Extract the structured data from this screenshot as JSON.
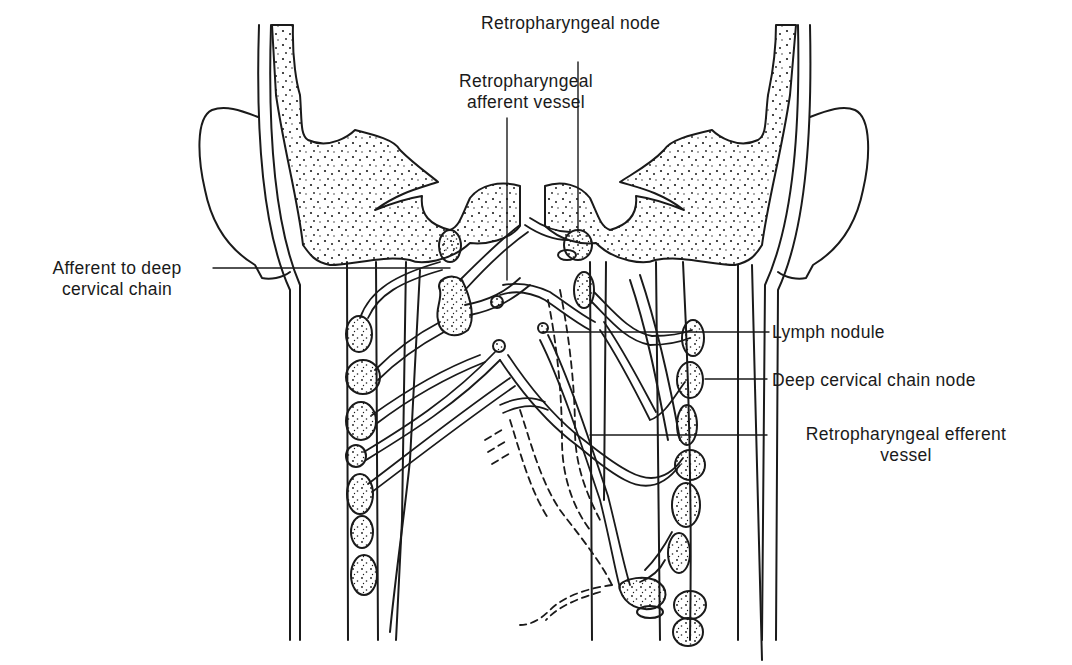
{
  "diagram": {
    "line_color": "#1a1a1a",
    "background": "#ffffff"
  },
  "labels": {
    "retropharyngeal_node": {
      "text": "Retropharyngeal node"
    },
    "retropharyngeal_afferent": {
      "line1": "Retropharyngeal",
      "line2": "afferent vessel"
    },
    "afferent_deep_cervical": {
      "line1": "Afferent to deep",
      "line2": "cervical chain"
    },
    "lymph_nodule": {
      "text": "Lymph nodule"
    },
    "deep_cervical_node": {
      "text": "Deep cervical chain node"
    },
    "retropharyngeal_efferent": {
      "line1": "Retropharyngeal efferent",
      "line2": "vessel"
    }
  }
}
